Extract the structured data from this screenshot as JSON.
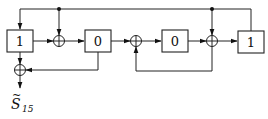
{
  "diagram": {
    "type": "shift-register-circuit",
    "registers": [
      {
        "id": "r1",
        "value": "1"
      },
      {
        "id": "r2",
        "value": "0"
      },
      {
        "id": "r3",
        "value": "0"
      },
      {
        "id": "r4",
        "value": "1"
      }
    ],
    "adders": [
      {
        "id": "xor-out",
        "symbol": "⊕"
      },
      {
        "id": "xor-1",
        "symbol": "⊕"
      },
      {
        "id": "xor-2",
        "symbol": "⊕"
      },
      {
        "id": "xor-3",
        "symbol": "⊕"
      }
    ],
    "output": {
      "label": "S",
      "accent": "~",
      "subscript": "15"
    },
    "colors": {
      "line": "#222222",
      "background": "#ffffff"
    }
  }
}
